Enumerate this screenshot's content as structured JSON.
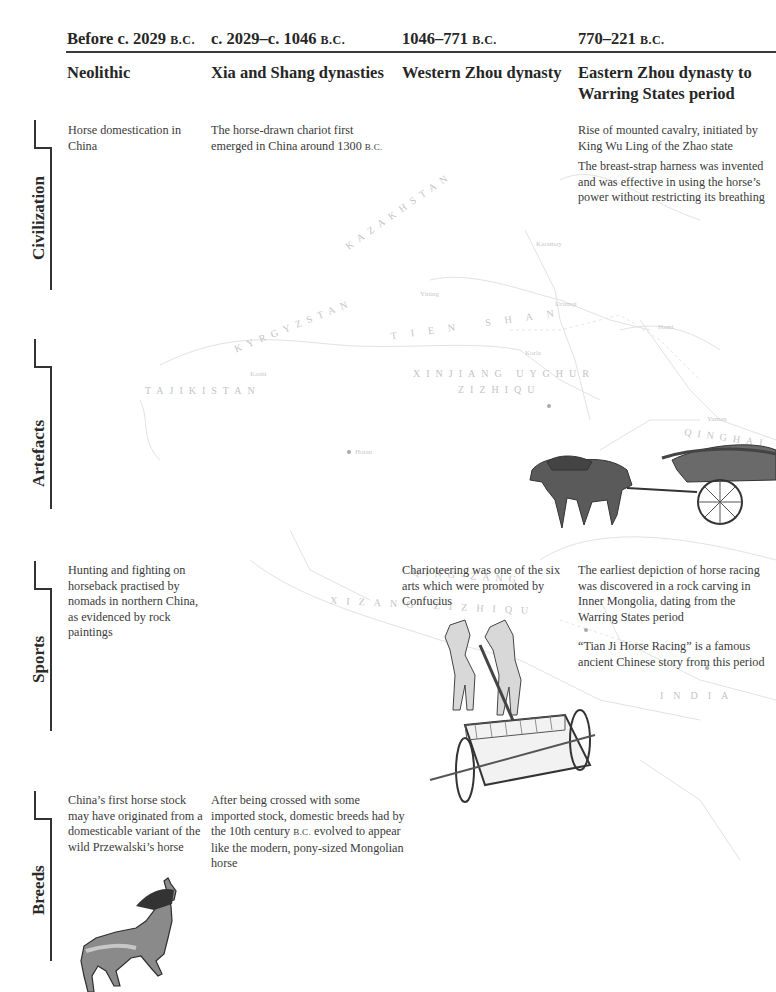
{
  "timeline": {
    "columns": [
      {
        "date_main": "Before c. 2029 ",
        "date_era": "B.C.",
        "period": "Neolithic"
      },
      {
        "date_main": "c. 2029–c. 1046 ",
        "date_era": "B.C.",
        "period": "Xia and Shang dynasties"
      },
      {
        "date_main": "1046–771 ",
        "date_era": "B.C.",
        "period": "Western Zhou dynasty"
      },
      {
        "date_main": "770–221 ",
        "date_era": "B.C.",
        "period": "Eastern Zhou dynasty to Warring States period"
      }
    ],
    "categories": [
      {
        "label": "Civilization"
      },
      {
        "label": "Artefacts"
      },
      {
        "label": "Sports"
      },
      {
        "label": "Breeds"
      }
    ],
    "civilization": {
      "neolithic": "Horse domestication in China",
      "xia_shang_main": "The horse-drawn chariot first emerged in China around 1300 ",
      "xia_shang_era": "B.C.",
      "eastern_zhou": [
        "Rise of mounted cavalry, initiated by King Wu Ling of the Zhao state",
        "The breast-strap harness was invented and was effective in using the horse’s power without restricting its breathing"
      ]
    },
    "sports": {
      "neolithic": "Hunting and fighting on horseback practised by nomads in northern China, as evidenced by rock paintings",
      "western_zhou": "Charioteering was one of the six arts which were promoted by Confucius",
      "eastern_zhou": [
        "The earliest depiction of horse racing was discovered in a rock carving in Inner Mongolia, dating from the Warring States period",
        "“Tian Ji Horse Racing” is a famous ancient Chinese story from this period"
      ]
    },
    "breeds": {
      "neolithic": "China’s first horse stock may have originated from a domesticable variant of the wild Przewalski’s horse",
      "xia_shang_pre": "After being crossed with some imported stock, domestic breeds had by the 10th century ",
      "xia_shang_era": "B.C.",
      "xia_shang_post": " evolved to appear like the modern, pony-sized Mongolian horse"
    },
    "illustrations": [
      {
        "name": "covered-bronze-chariot-illustration"
      },
      {
        "name": "two-horse-chariot-illustration"
      },
      {
        "name": "przewalski-horse-illustration"
      }
    ]
  },
  "map": {
    "labels": [
      "KAZAKHSTAN",
      "KYRGYZSTAN",
      "TAJIKISTAN",
      "TIEN SHAN",
      "XINJIANG UYGHUR",
      "ZIZHIQU",
      "QINGHAI",
      "QING-ZANG",
      "XIZANG ZIZHIQU",
      "INDIA"
    ],
    "cities": [
      "Karamay",
      "Yining",
      "Urumqi",
      "Kashi",
      "Korla",
      "Hotan",
      "Hami",
      "Yumen"
    ]
  }
}
